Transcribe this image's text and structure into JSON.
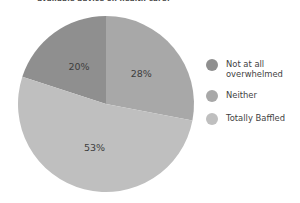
{
  "chart_data": {
    "type": "pie",
    "title": "available advice on health care?",
    "xlabel": "",
    "ylabel": "",
    "legend_position": "right",
    "grid": false,
    "categories": [
      "Not at all overwhelmed",
      "Neither",
      "Totally Baffled"
    ],
    "values": [
      20,
      28,
      53
    ],
    "slices": [
      {
        "label": "Not at all overwhelmed",
        "value": 20,
        "display": "20%",
        "color": "#8f8f8f",
        "start_angle_deg": 288,
        "end_angle_deg": 360
      },
      {
        "label": "Neither",
        "value": 28,
        "display": "28%",
        "color": "#a8a8a8",
        "start_angle_deg": 0,
        "end_angle_deg": 100.8
      },
      {
        "label": "Totally Baffled",
        "value": 53,
        "display": "53%",
        "color": "#bfbfbf",
        "start_angle_deg": 100.8,
        "end_angle_deg": 288
      }
    ]
  },
  "legend": {
    "items": [
      {
        "label": "Not at all\noverwhelmed",
        "color": "#8f8f8f"
      },
      {
        "label": "Neither",
        "color": "#a8a8a8"
      },
      {
        "label": "Totally Baffled",
        "color": "#bfbfbf"
      }
    ]
  }
}
